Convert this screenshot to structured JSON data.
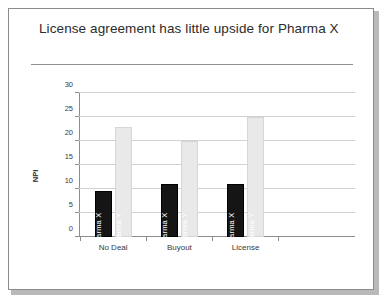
{
  "slide": {
    "title": "License agreement has little upside for Pharma X",
    "caption": ""
  },
  "chart_data": {
    "type": "bar",
    "title": "License agreement has little upside for Pharma X",
    "xlabel": "",
    "ylabel": "NPI",
    "ylim": [
      0,
      30
    ],
    "ytick_step": 5,
    "yticks": [
      "30",
      "25",
      "20",
      "15",
      "10",
      "5",
      "0"
    ],
    "grid": true,
    "legend": "in-bar labels",
    "categories": [
      "No Deal",
      "Buyout",
      "License"
    ],
    "series": [
      {
        "name": "Pharma X",
        "color": "#151515",
        "values": [
          9.5,
          11,
          11
        ]
      },
      {
        "name": "Pharma Y",
        "color": "#e9e9e9",
        "values": [
          23,
          20,
          25
        ]
      }
    ]
  }
}
